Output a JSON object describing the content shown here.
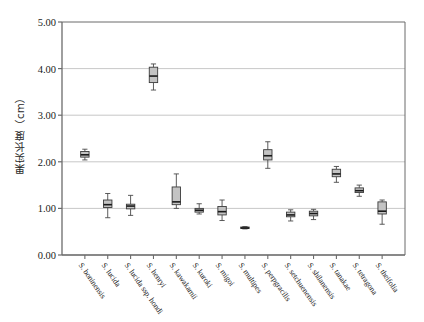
{
  "chart_data": {
    "type": "box",
    "title": "",
    "xlabel": "",
    "ylabel": "果实长度（cm）",
    "ylim": [
      0.0,
      5.0
    ],
    "ytick_labels": [
      "0.00",
      "1.00",
      "2.00",
      "3.00",
      "4.00",
      "5.00"
    ],
    "ytick_values": [
      0.0,
      1.0,
      2.0,
      3.0,
      4.0,
      5.0
    ],
    "grid": "horizontal",
    "legend": "none",
    "categories": [
      "S. boninensis",
      "S. lucida",
      "S. lucida ssp. hondi",
      "S. henryi",
      "S. kawakamii",
      "S. kuroki",
      "S. migoi",
      "S. multipes",
      "S. perpgracilis",
      "S. setchuenensis",
      "S. shilanensis",
      "S. tanakae",
      "S. tetragona",
      "S. theifolia"
    ],
    "boxes": [
      {
        "category": "S. boninensis",
        "min": 2.04,
        "q1": 2.1,
        "median": 2.15,
        "q3": 2.22,
        "max": 2.27
      },
      {
        "category": "S. lucida",
        "min": 0.8,
        "q1": 1.02,
        "median": 1.08,
        "q3": 1.18,
        "max": 1.32
      },
      {
        "category": "S. lucida ssp. hondi",
        "min": 0.85,
        "q1": 0.99,
        "median": 1.05,
        "q3": 1.09,
        "max": 1.28
      },
      {
        "category": "S. henryi",
        "min": 3.54,
        "q1": 3.7,
        "median": 3.84,
        "q3": 4.03,
        "max": 4.1
      },
      {
        "category": "S. kawakamii",
        "min": 1.0,
        "q1": 1.08,
        "median": 1.14,
        "q3": 1.46,
        "max": 1.74
      },
      {
        "category": "S. kuroki",
        "min": 0.88,
        "q1": 0.92,
        "median": 0.96,
        "q3": 1.0,
        "max": 1.1
      },
      {
        "category": "S. migoi",
        "min": 0.74,
        "q1": 0.86,
        "median": 0.93,
        "q3": 1.04,
        "max": 1.18
      },
      {
        "category": "S. multipes",
        "min": 0.56,
        "q1": 0.57,
        "median": 0.58,
        "q3": 0.6,
        "max": 0.61
      },
      {
        "category": "S. perpgracilis",
        "min": 1.86,
        "q1": 2.04,
        "median": 2.13,
        "q3": 2.26,
        "max": 2.43
      },
      {
        "category": "S. setchuenensis",
        "min": 0.73,
        "q1": 0.82,
        "median": 0.86,
        "q3": 0.92,
        "max": 0.97
      },
      {
        "category": "S. shilanensis",
        "min": 0.76,
        "q1": 0.84,
        "median": 0.89,
        "q3": 0.94,
        "max": 0.98
      },
      {
        "category": "S. tanakae",
        "min": 1.56,
        "q1": 1.68,
        "median": 1.74,
        "q3": 1.84,
        "max": 1.9
      },
      {
        "category": "S. tetragona",
        "min": 1.26,
        "q1": 1.34,
        "median": 1.38,
        "q3": 1.44,
        "max": 1.5
      },
      {
        "category": "S. theifolia",
        "min": 0.66,
        "q1": 0.88,
        "median": 0.94,
        "q3": 1.14,
        "max": 1.18
      }
    ]
  },
  "style": {
    "box_fill": "#c3c3c3",
    "box_edge": "#3b3b3b",
    "median_color": "#1a1a1a",
    "whisker_color": "#4a4a4a",
    "grid_color": "#b9b9b9",
    "axis_color": "#6b6b6b",
    "background": "#ffffff"
  }
}
